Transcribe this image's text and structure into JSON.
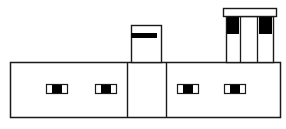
{
  "diagram": {
    "title": "Building elevation line drawing",
    "stroke_color": "#1a1a1a",
    "fill_color": "#000000",
    "background": "#ffffff",
    "main_body": {
      "x": 10,
      "y": 62,
      "w": 270,
      "h": 55
    },
    "dividers": [
      127,
      166
    ],
    "left_tower": {
      "x": 131,
      "y": 25,
      "w": 30,
      "h": 37,
      "bar": {
        "x": 131,
        "y": 33,
        "w": 26,
        "h": 5
      }
    },
    "right_tower": {
      "cap": {
        "x": 223,
        "y": 8,
        "w": 53,
        "h": 8
      },
      "body": {
        "x": 226,
        "y": 16,
        "w": 47,
        "h": 46
      },
      "inner_lines": [
        240,
        257
      ],
      "black_panels": [
        {
          "x": 227,
          "y": 16,
          "w": 12,
          "h": 18
        },
        {
          "x": 259,
          "y": 16,
          "w": 13,
          "h": 18
        }
      ]
    },
    "windows": [
      {
        "x": 46,
        "y": 84,
        "w": 21,
        "h": 9
      },
      {
        "x": 95,
        "y": 84,
        "w": 21,
        "h": 9
      },
      {
        "x": 177,
        "y": 84,
        "w": 21,
        "h": 9
      },
      {
        "x": 224,
        "y": 84,
        "w": 21,
        "h": 9
      }
    ]
  }
}
